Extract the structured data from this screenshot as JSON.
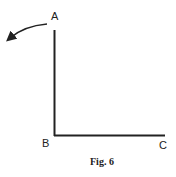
{
  "diagram": {
    "labels": {
      "a": "A",
      "b": "B",
      "c": "C"
    },
    "caption": "Fig. 6",
    "line_color": "#222222"
  }
}
